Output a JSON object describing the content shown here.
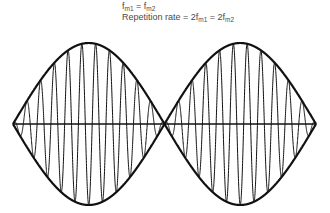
{
  "diagram": {
    "title_line1": {
      "parts": [
        {
          "text": "f",
          "sub": "m1"
        },
        {
          "text": " = f",
          "sub": "m2"
        }
      ]
    },
    "title_line2": {
      "parts": [
        {
          "text": "Repetition rate = 2f",
          "sub": "m1"
        },
        {
          "text": " = 2f",
          "sub": "m2"
        }
      ]
    },
    "colors": {
      "stroke": "#111111",
      "text": "#4a4a4a",
      "background": "#ffffff"
    },
    "waveform": {
      "x_start": 13,
      "x_end": 316,
      "baseline_y": 124,
      "amplitude": 81,
      "lobes": 2,
      "carrier_cycles_per_lobe": 11,
      "description": "Amplitude-modulated carrier with envelope and axis"
    }
  }
}
